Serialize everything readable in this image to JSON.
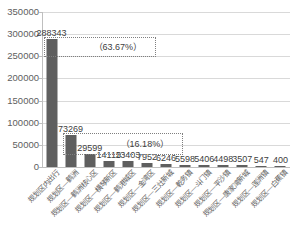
{
  "chart_data": {
    "type": "bar",
    "title": "",
    "xlabel": "",
    "ylabel": "",
    "ylim": [
      0,
      350000
    ],
    "ytick_step": 50000,
    "grid": true,
    "legend": "none",
    "bar_color": "#5f5f5f",
    "categories": [
      "规划区内出行",
      "规划区—鹤洲",
      "规划区—鹤洲核心区",
      "规划区—横琴新区",
      "规划区—鹤港城区",
      "规划区—金湾区",
      "规划区—三灶新城",
      "规划区—乾务镇",
      "规划区—斗门镇",
      "规划区—平沙镇",
      "规划区—唐家湾新城",
      "规划区—莲洲镇",
      "规划区—白蕉镇"
    ],
    "values": [
      288343,
      73269,
      29599,
      14113,
      13403,
      7952,
      6246,
      5598,
      5406,
      4498,
      3507,
      547,
      400
    ],
    "y_tick_labels": [
      "350000",
      "300000",
      "250000",
      "200000",
      "150000",
      "100000",
      "50000",
      "0"
    ],
    "annotations": [
      {
        "text": "（63.67%）",
        "target_category": "规划区内出行",
        "target_value": 288343
      },
      {
        "text": "（16.18%）",
        "target_category": "规划区—鹤洲",
        "target_value": 73269
      }
    ]
  }
}
